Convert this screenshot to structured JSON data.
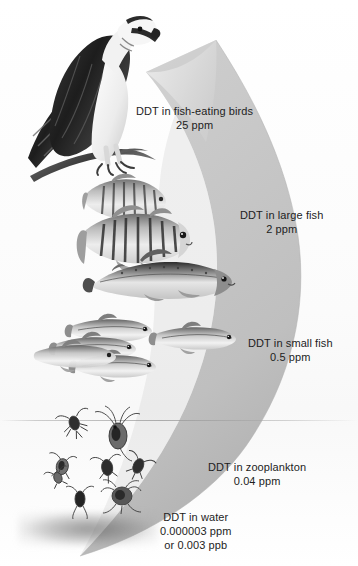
{
  "diagram": {
    "background_color": "#ffffff",
    "arrow_color": "#c9c9c9",
    "text_color": "#1d1d1d"
  },
  "levels": [
    {
      "id": "fish-eating-birds",
      "organism": "osprey",
      "line1": "DDT in fish-eating birds",
      "line2": "25 ppm",
      "concentration_ppm": 25
    },
    {
      "id": "large-fish",
      "organism": "perch-and-salmon",
      "line1": "DDT in large fish",
      "line2": "2 ppm",
      "concentration_ppm": 2
    },
    {
      "id": "small-fish",
      "organism": "minnow-school",
      "line1": "DDT in small fish",
      "line2": "0.5 ppm",
      "concentration_ppm": 0.5
    },
    {
      "id": "zooplankton",
      "organism": "zooplankton",
      "line1": "DDT in zooplankton",
      "line2": "0.04 ppm",
      "concentration_ppm": 0.04
    },
    {
      "id": "water",
      "organism": "water",
      "line1": "DDT in water",
      "line2": "0.000003 ppm",
      "line3": "or 0.003 ppb",
      "concentration_ppm": 3e-06,
      "concentration_ppb": 0.003
    }
  ]
}
